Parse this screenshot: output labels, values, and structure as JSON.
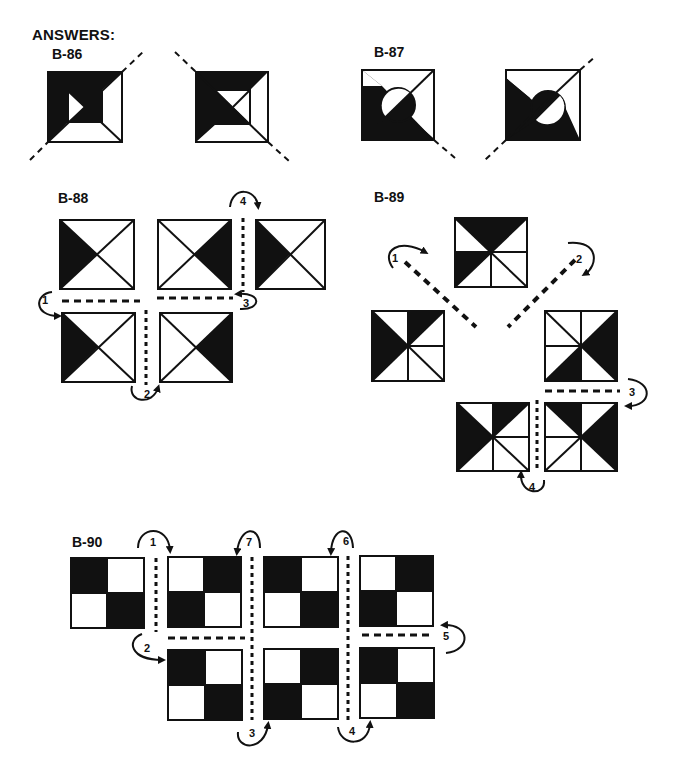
{
  "page": {
    "cutoff_line": "",
    "heading": "ANSWERS:"
  },
  "puzzles": [
    {
      "id": "B-86",
      "label": "B-86",
      "description": "Two squares with nested inner square and diagonal dashed lines showing reflection"
    },
    {
      "id": "B-87",
      "label": "B-87",
      "description": "Two squares with circle and diagonal dashed lines showing reflection"
    },
    {
      "id": "B-88",
      "label": "B-88",
      "description": "Five squares with X diagonals, shaded triangles, fold sequence arrows 1-4",
      "steps": [
        "1",
        "2",
        "3",
        "4"
      ]
    },
    {
      "id": "B-89",
      "label": "B-89",
      "description": "Five pinwheel squares, fold sequence arrows 1-4",
      "steps": [
        "1",
        "2",
        "3",
        "4"
      ]
    },
    {
      "id": "B-90",
      "label": "B-90",
      "description": "Seven checkerboard squares, fold sequence arrows 1-7",
      "steps": [
        "1",
        "2",
        "3",
        "4",
        "5",
        "6",
        "7"
      ]
    }
  ],
  "colors": {
    "ink": "#111111",
    "paper": "#ffffff"
  }
}
